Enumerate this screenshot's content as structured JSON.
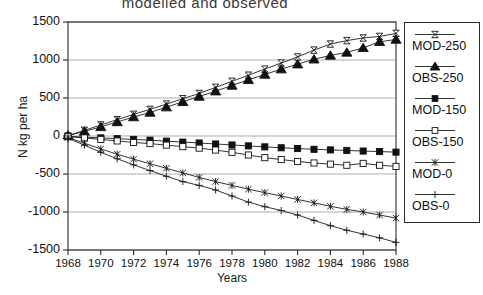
{
  "chart_data": {
    "type": "line",
    "title": "modelled  and  observed",
    "xlabel": "Years",
    "ylabel": "N kg per ha",
    "xlim": [
      1968,
      1988
    ],
    "ylim": [
      -1500,
      1500
    ],
    "yticks": [
      1500,
      1000,
      500,
      0,
      -500,
      -1000,
      -1500
    ],
    "xticks": [
      1968,
      1970,
      1972,
      1974,
      1976,
      1978,
      1980,
      1982,
      1984,
      1986,
      1988
    ],
    "grid": true,
    "legend_position": "right-outside",
    "x": [
      1968,
      1969,
      1970,
      1971,
      1972,
      1973,
      1974,
      1975,
      1976,
      1977,
      1978,
      1979,
      1980,
      1981,
      1982,
      1983,
      1984,
      1985,
      1986,
      1987,
      1988
    ],
    "series": [
      {
        "name": "MOD-250",
        "marker": "bowtie",
        "fill": "open",
        "values": [
          0,
          75,
          145,
          215,
          285,
          350,
          420,
          490,
          560,
          640,
          720,
          800,
          880,
          960,
          1040,
          1130,
          1210,
          1255,
          1290,
          1310,
          1350
        ]
      },
      {
        "name": "OBS-250",
        "marker": "triangle",
        "fill": "filled",
        "values": [
          10,
          60,
          120,
          185,
          250,
          310,
          380,
          450,
          520,
          590,
          665,
          740,
          810,
          880,
          945,
          1010,
          1060,
          1100,
          1160,
          1240,
          1270
        ]
      },
      {
        "name": "MOD-150",
        "marker": "square",
        "fill": "filled",
        "values": [
          -5,
          -15,
          -25,
          -35,
          -45,
          -55,
          -68,
          -80,
          -92,
          -105,
          -118,
          -130,
          -143,
          -155,
          -165,
          -175,
          -183,
          -190,
          -198,
          -205,
          -212
        ]
      },
      {
        "name": "OBS-150",
        "marker": "square",
        "fill": "open",
        "values": [
          -8,
          -25,
          -45,
          -65,
          -85,
          -100,
          -120,
          -140,
          -160,
          -185,
          -215,
          -250,
          -285,
          -310,
          -335,
          -355,
          -370,
          -385,
          -360,
          -385,
          -400
        ]
      },
      {
        "name": "MOD-0",
        "marker": "cross-x",
        "fill": "open",
        "values": [
          -20,
          -95,
          -170,
          -240,
          -305,
          -365,
          -425,
          -485,
          -545,
          -600,
          -650,
          -700,
          -745,
          -790,
          -835,
          -880,
          -925,
          -965,
          -1000,
          -1040,
          -1080
        ]
      },
      {
        "name": "OBS-0",
        "marker": "plus",
        "fill": "open",
        "values": [
          -30,
          -120,
          -215,
          -300,
          -380,
          -455,
          -530,
          -600,
          -650,
          -710,
          -790,
          -870,
          -930,
          -980,
          -1040,
          -1110,
          -1180,
          -1240,
          -1290,
          -1340,
          -1400
        ]
      }
    ]
  },
  "legend": {
    "entries": [
      {
        "label": "MOD-250"
      },
      {
        "label": "OBS-250"
      },
      {
        "label": "MOD-150"
      },
      {
        "label": "OBS-150"
      },
      {
        "label": "MOD-0"
      },
      {
        "label": "OBS-0"
      }
    ]
  }
}
